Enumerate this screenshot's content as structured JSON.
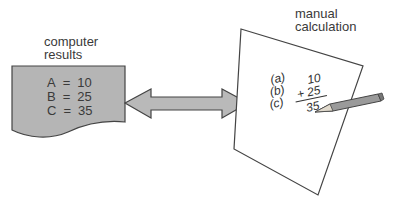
{
  "computer": {
    "label_line1": "computer",
    "label_line2": "results",
    "rows": [
      {
        "var": "A",
        "eq": "=",
        "val": "10"
      },
      {
        "var": "B",
        "eq": "=",
        "val": "25"
      },
      {
        "var": "C",
        "eq": "=",
        "val": "35"
      }
    ],
    "fill_color": "#b5b5b5"
  },
  "arrow": {
    "type": "double-headed",
    "fill_color": "#b9b9b9"
  },
  "manual": {
    "label_line1": "manual",
    "label_line2": "calculation",
    "labels": [
      "(a)",
      "(b)",
      "(c)"
    ],
    "operand1": "10",
    "operand2": "+ 25",
    "result": "35"
  }
}
